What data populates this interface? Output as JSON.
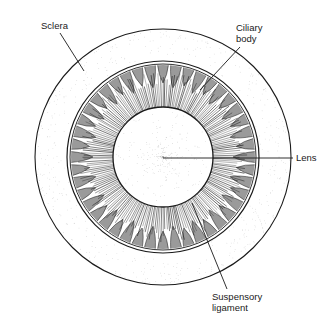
{
  "figure": {
    "colors": {
      "ink": "#1a1a1a",
      "ciliary_fill": "#9a9a9a",
      "background": "#ffffff",
      "stipple": "#b8b8b8"
    }
  },
  "labels": {
    "sclera": "Sclera",
    "ciliary_line1": "Ciliary",
    "ciliary_line2": "body",
    "lens": "Lens",
    "suspensory_line1": "Suspensory",
    "suspensory_line2": "ligament"
  }
}
